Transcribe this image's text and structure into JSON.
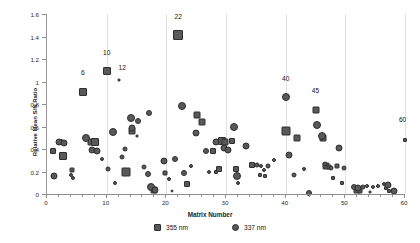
{
  "chart_data": {
    "type": "scatter",
    "title": "",
    "xlabel": "Matrix Number",
    "ylabel": "Relative Mean S/N Ratio",
    "xlim": [
      0,
      60
    ],
    "ylim": [
      0,
      1.6
    ],
    "grid": "vertical",
    "legend_position": "bottom-center",
    "x_ticks": [
      0,
      10,
      20,
      30,
      40,
      50,
      60
    ],
    "x_tick_labels": [
      "0",
      "10",
      "20",
      "30",
      "40",
      "50",
      "60"
    ],
    "x_minor_tick_step": 2,
    "y_ticks": [
      0,
      0.2,
      0.4,
      0.6,
      0.8,
      1,
      1.2,
      1.4,
      1.6
    ],
    "y_tick_labels": [
      "0",
      "0.2",
      "0.4",
      "0.6",
      "0.8",
      "1",
      "1.2",
      "1.4",
      "1.6"
    ],
    "marker_color": "#595959",
    "marker_edge_color": "#2e2e2e",
    "series": [
      {
        "name": "355 nm",
        "marker": "square",
        "points": [
          {
            "x": 1.0,
            "y": 0.38,
            "s": 6
          },
          {
            "x": 2.2,
            "y": 0.46,
            "s": 6
          },
          {
            "x": 2.6,
            "y": 0.34,
            "s": 8
          },
          {
            "x": 4.2,
            "y": 0.21,
            "s": 5
          },
          {
            "x": 6.0,
            "y": 0.91,
            "s": 8
          },
          {
            "x": 7.3,
            "y": 0.46,
            "s": 7
          },
          {
            "x": 8.1,
            "y": 0.46,
            "s": 8
          },
          {
            "x": 10.0,
            "y": 1.09,
            "s": 8
          },
          {
            "x": 12.0,
            "y": 1.01,
            "s": 3
          },
          {
            "x": 13.2,
            "y": 0.2,
            "s": 9
          },
          {
            "x": 14.3,
            "y": 0.56,
            "s": 7
          },
          {
            "x": 15.1,
            "y": 0.52,
            "s": 3
          },
          {
            "x": 17.9,
            "y": 0.04,
            "s": 7
          },
          {
            "x": 19.8,
            "y": 0.19,
            "s": 5
          },
          {
            "x": 22.0,
            "y": 1.41,
            "s": 10
          },
          {
            "x": 23.4,
            "y": 0.09,
            "s": 6
          },
          {
            "x": 25.2,
            "y": 0.7,
            "s": 7
          },
          {
            "x": 25.9,
            "y": 0.64,
            "s": 7
          },
          {
            "x": 27.8,
            "y": 0.38,
            "s": 6
          },
          {
            "x": 28.4,
            "y": 0.2,
            "s": 4
          },
          {
            "x": 29.3,
            "y": 0.47,
            "s": 8
          },
          {
            "x": 29.9,
            "y": 0.46,
            "s": 7
          },
          {
            "x": 31.0,
            "y": 0.47,
            "s": 6
          },
          {
            "x": 28.9,
            "y": 0.22,
            "s": 6
          },
          {
            "x": 31.6,
            "y": 0.22,
            "s": 6
          },
          {
            "x": 34.3,
            "y": 0.26,
            "s": 6
          },
          {
            "x": 35.7,
            "y": 0.17,
            "s": 4
          },
          {
            "x": 36.6,
            "y": 0.16,
            "s": 4
          },
          {
            "x": 40.0,
            "y": 0.56,
            "s": 9
          },
          {
            "x": 41.9,
            "y": 0.5,
            "s": 7
          },
          {
            "x": 45.0,
            "y": 0.75,
            "s": 7
          },
          {
            "x": 46.3,
            "y": 0.5,
            "s": 7
          },
          {
            "x": 46.8,
            "y": 0.25,
            "s": 7
          },
          {
            "x": 47.3,
            "y": 0.24,
            "s": 5
          },
          {
            "x": 47.9,
            "y": 0.14,
            "s": 4
          },
          {
            "x": 48.6,
            "y": 0.25,
            "s": 5
          },
          {
            "x": 49.4,
            "y": 0.1,
            "s": 4
          },
          {
            "x": 51.9,
            "y": 0.04,
            "s": 7
          },
          {
            "x": 52.4,
            "y": 0.03,
            "s": 5
          },
          {
            "x": 54.2,
            "y": 0.02,
            "s": 3
          },
          {
            "x": 56.8,
            "y": 0.05,
            "s": 4
          },
          {
            "x": 57.4,
            "y": 0.03,
            "s": 4
          },
          {
            "x": 60.0,
            "y": 0.48,
            "s": 4
          }
        ]
      },
      {
        "name": "337 nm",
        "marker": "circle",
        "points": [
          {
            "x": 1.1,
            "y": 0.16,
            "s": 7
          },
          {
            "x": 2.0,
            "y": 0.46,
            "s": 7
          },
          {
            "x": 2.8,
            "y": 0.45,
            "s": 7
          },
          {
            "x": 4.1,
            "y": 0.17,
            "s": 4
          },
          {
            "x": 4.4,
            "y": 0.14,
            "s": 4
          },
          {
            "x": 6.5,
            "y": 0.5,
            "s": 8
          },
          {
            "x": 7.6,
            "y": 0.39,
            "s": 7
          },
          {
            "x": 8.3,
            "y": 0.38,
            "s": 7
          },
          {
            "x": 9.3,
            "y": 0.31,
            "s": 4
          },
          {
            "x": 11.0,
            "y": 0.55,
            "s": 8
          },
          {
            "x": 10.3,
            "y": 0.22,
            "s": 5
          },
          {
            "x": 11.4,
            "y": 0.1,
            "s": 4
          },
          {
            "x": 12.6,
            "y": 0.33,
            "s": 5
          },
          {
            "x": 13.1,
            "y": 0.4,
            "s": 5
          },
          {
            "x": 14.0,
            "y": 0.68,
            "s": 8
          },
          {
            "x": 14.2,
            "y": 0.59,
            "s": 7
          },
          {
            "x": 15.3,
            "y": 0.65,
            "s": 6
          },
          {
            "x": 16.2,
            "y": 0.24,
            "s": 5
          },
          {
            "x": 16.9,
            "y": 0.18,
            "s": 6
          },
          {
            "x": 17.5,
            "y": 0.06,
            "s": 8
          },
          {
            "x": 18.1,
            "y": 0.04,
            "s": 7
          },
          {
            "x": 19.6,
            "y": 0.29,
            "s": 7
          },
          {
            "x": 20.5,
            "y": 0.13,
            "s": 4
          },
          {
            "x": 20.9,
            "y": 0.03,
            "s": 3
          },
          {
            "x": 21.5,
            "y": 0.31,
            "s": 6
          },
          {
            "x": 23.0,
            "y": 0.19,
            "s": 6
          },
          {
            "x": 24.2,
            "y": 0.25,
            "s": 4
          },
          {
            "x": 25.0,
            "y": 0.54,
            "s": 7
          },
          {
            "x": 26.6,
            "y": 0.38,
            "s": 6
          },
          {
            "x": 27.1,
            "y": 0.2,
            "s": 4
          },
          {
            "x": 28.3,
            "y": 0.46,
            "s": 7
          },
          {
            "x": 29.6,
            "y": 0.41,
            "s": 7
          },
          {
            "x": 30.3,
            "y": 0.39,
            "s": 7
          },
          {
            "x": 31.3,
            "y": 0.6,
            "s": 8
          },
          {
            "x": 31.9,
            "y": 0.16,
            "s": 8
          },
          {
            "x": 32.0,
            "y": 0.1,
            "s": 4
          },
          {
            "x": 33.4,
            "y": 0.43,
            "s": 7
          },
          {
            "x": 35.2,
            "y": 0.26,
            "s": 5
          },
          {
            "x": 35.9,
            "y": 0.25,
            "s": 4
          },
          {
            "x": 36.3,
            "y": 0.21,
            "s": 4
          },
          {
            "x": 37.0,
            "y": 0.25,
            "s": 5
          },
          {
            "x": 38.1,
            "y": 0.3,
            "s": 4
          },
          {
            "x": 40.5,
            "y": 0.35,
            "s": 7
          },
          {
            "x": 41.4,
            "y": 0.17,
            "s": 5
          },
          {
            "x": 43.0,
            "y": 0.22,
            "s": 4
          },
          {
            "x": 43.9,
            "y": 0.01,
            "s": 6
          },
          {
            "x": 45.2,
            "y": 0.61,
            "s": 8
          },
          {
            "x": 46.1,
            "y": 0.52,
            "s": 8
          },
          {
            "x": 46.6,
            "y": 0.27,
            "s": 5
          },
          {
            "x": 47.6,
            "y": 0.23,
            "s": 5
          },
          {
            "x": 49.0,
            "y": 0.41,
            "s": 7
          },
          {
            "x": 49.7,
            "y": 0.23,
            "s": 5
          },
          {
            "x": 40.0,
            "y": 0.86,
            "s": 8
          },
          {
            "x": 51.5,
            "y": 0.06,
            "s": 6
          },
          {
            "x": 52.1,
            "y": 0.05,
            "s": 7
          },
          {
            "x": 53.0,
            "y": 0.06,
            "s": 5
          },
          {
            "x": 53.6,
            "y": 0.07,
            "s": 4
          },
          {
            "x": 54.6,
            "y": 0.06,
            "s": 4
          },
          {
            "x": 55.4,
            "y": 0.07,
            "s": 4
          },
          {
            "x": 56.4,
            "y": 0.09,
            "s": 4
          },
          {
            "x": 57.2,
            "y": 0.08,
            "s": 7
          },
          {
            "x": 58.2,
            "y": 0.03,
            "s": 7
          },
          {
            "x": 22.6,
            "y": 0.78,
            "s": 8
          },
          {
            "x": 17.1,
            "y": 0.72,
            "s": 6
          }
        ]
      }
    ],
    "annotations": [
      {
        "text": "6",
        "x": 6.0,
        "y": 1.05
      },
      {
        "text": "10",
        "x": 10.0,
        "y": 1.23
      },
      {
        "text": "12",
        "x": 12.6,
        "y": 1.09
      },
      {
        "text": "22",
        "x": 22.0,
        "y": 1.55
      },
      {
        "text": "40",
        "x": 40.0,
        "y": 1.0
      },
      {
        "text": "45",
        "x": 45.0,
        "y": 0.89
      },
      {
        "text": "60",
        "x": 59.6,
        "y": 0.63
      }
    ]
  }
}
